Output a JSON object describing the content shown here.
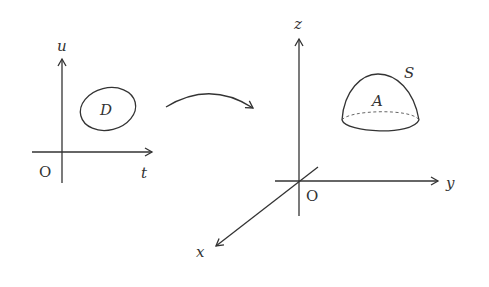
{
  "left_plane": {
    "vertical_axis_label": "u",
    "horizontal_axis_label": "t",
    "origin_label": "O",
    "region_label": "D"
  },
  "mapping_arrow": {
    "direction": "left-to-right"
  },
  "right_space": {
    "z_axis_label": "z",
    "y_axis_label": "y",
    "x_axis_label": "x",
    "origin_label": "O",
    "surface_label": "S",
    "surface_region_label": "A"
  }
}
